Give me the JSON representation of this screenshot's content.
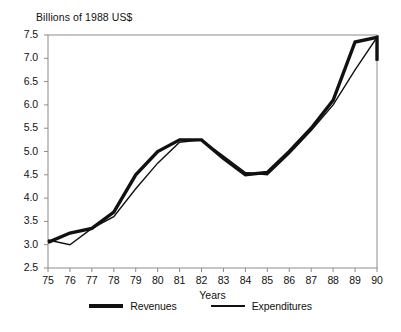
{
  "chart_data": {
    "type": "line",
    "title": "Billions of 1988 US$",
    "xlabel": "Years",
    "ylabel": "",
    "categories": [
      "75",
      "76",
      "77",
      "78",
      "79",
      "80",
      "81",
      "82",
      "83",
      "84",
      "85",
      "86",
      "87",
      "88",
      "89",
      "90"
    ],
    "x": [
      75,
      76,
      77,
      78,
      79,
      80,
      81,
      82,
      83,
      84,
      85,
      86,
      87,
      88,
      89,
      90
    ],
    "xlim": [
      75,
      90
    ],
    "ylim": [
      2.5,
      7.5
    ],
    "yticks": [
      2.5,
      3.0,
      3.5,
      4.0,
      4.5,
      5.0,
      5.5,
      6.0,
      6.5,
      7.0,
      7.5
    ],
    "ytick_labels": [
      "2.5",
      "3.0",
      "3.5",
      "4.0",
      "4.5",
      "5.0",
      "5.5",
      "6.0",
      "6.5",
      "7.0",
      "7.5"
    ],
    "xticks": [
      75,
      76,
      77,
      78,
      79,
      80,
      81,
      82,
      83,
      84,
      85,
      86,
      87,
      88,
      89,
      90
    ],
    "xtick_labels": [
      "75",
      "76",
      "77",
      "78",
      "79",
      "80",
      "81",
      "82",
      "83",
      "84",
      "85",
      "86",
      "87",
      "88",
      "89",
      "90"
    ],
    "grid": false,
    "legend_position": "bottom",
    "series": [
      {
        "name": "Revenues",
        "color": "#111111",
        "line_width": 3.4,
        "values": [
          3.05,
          3.25,
          3.35,
          3.7,
          4.5,
          5.0,
          5.25,
          5.25,
          4.85,
          4.5,
          4.55,
          5.0,
          5.5,
          6.1,
          7.35,
          7.45
        ]
      },
      {
        "name": "Expenditures",
        "color": "#111111",
        "line_width": 1.4,
        "values": [
          3.1,
          3.0,
          3.35,
          3.6,
          4.2,
          4.75,
          5.2,
          5.25,
          4.9,
          4.55,
          4.5,
          4.95,
          5.45,
          6.0,
          6.75,
          7.45
        ]
      }
    ],
    "note_last_point": {
      "label": "90",
      "revenues": 6.95,
      "expenditures": 6.95
    }
  },
  "legend": {
    "items": [
      {
        "label": "Revenues",
        "style": "thick"
      },
      {
        "label": "Expenditures",
        "style": "thin"
      }
    ]
  }
}
